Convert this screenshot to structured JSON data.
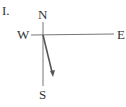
{
  "item_label": "I.",
  "compass": {
    "north": "N",
    "south": "S",
    "east": "E",
    "west": "W"
  },
  "colors": {
    "axis": "#777777",
    "arrow": "#555555",
    "text": "#333333"
  }
}
